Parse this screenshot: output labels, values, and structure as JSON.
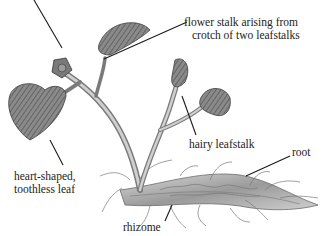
{
  "figure": {
    "style": "grayscale botanical engraving",
    "colors": {
      "background": "#ffffff",
      "ink": "#222222",
      "plant_dark": "#4a4a4a",
      "plant_mid": "#8c8c8c",
      "plant_light": "#c8c8c8"
    }
  },
  "labels": {
    "flower_stalk": {
      "line1": "flower stalk arising from",
      "line2": "crotch of two leafstalks"
    },
    "hairy_leafstalk": "hairy leafstalk",
    "root": "root",
    "heart_leaf": {
      "line1": "heart-shaped,",
      "line2": "toothless leaf"
    },
    "rhizome": "rhizome"
  }
}
